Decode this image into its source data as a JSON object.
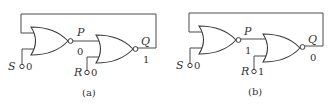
{
  "figure": {
    "type": "NOR-gate SR latch (two cross-coupled NOR gates)",
    "panels": [
      {
        "caption": "(a)",
        "inputs": {
          "S": {
            "label": "S",
            "value": "0"
          },
          "R": {
            "label": "R",
            "value": "0"
          }
        },
        "nodes": {
          "P": {
            "label": "P",
            "value": "0"
          },
          "Q": {
            "label": "Q",
            "value": "1"
          }
        }
      },
      {
        "caption": "(b)",
        "inputs": {
          "S": {
            "label": "S",
            "value": "0"
          },
          "R": {
            "label": "R",
            "value": "1"
          }
        },
        "nodes": {
          "P": {
            "label": "P",
            "value": "1"
          },
          "Q": {
            "label": "Q",
            "value": "0"
          }
        }
      }
    ]
  },
  "colors": {
    "line": "#3a3a3a",
    "text": "#333333",
    "background": "#ffffff"
  }
}
